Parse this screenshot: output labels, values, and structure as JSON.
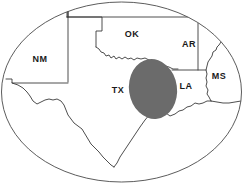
{
  "figure": {
    "type": "region-map",
    "width": 243,
    "height": 185,
    "background_color": "#ffffff",
    "frame": {
      "shape": "ellipse",
      "cx": 121.5,
      "cy": 92,
      "rx": 120,
      "ry": 90,
      "stroke_color": "#4a4a4a",
      "fill": "none"
    },
    "highlight": {
      "shape": "ellipse",
      "label": "shaded-study-area",
      "cx": 153,
      "cy": 89,
      "rx": 24,
      "ry": 30,
      "rotation_deg": -8,
      "fill_color": "#6b6b6b"
    }
  },
  "labels": {
    "new_mexico": "NM",
    "oklahoma": "OK",
    "texas": "TX",
    "arkansas": "AR",
    "louisiana": "LA",
    "mississippi": "MS"
  },
  "label_positions": {
    "new_mexico": {
      "x": 40,
      "y": 60
    },
    "oklahoma": {
      "x": 132,
      "y": 35
    },
    "texas": {
      "x": 118,
      "y": 91
    },
    "arkansas": {
      "x": 189,
      "y": 45
    },
    "louisiana": {
      "x": 186,
      "y": 87
    },
    "mississippi": {
      "x": 219,
      "y": 77
    }
  },
  "colors": {
    "border_stroke": "#3a3a3a",
    "frame_stroke": "#4a4a4a",
    "state_fill": "#ffffff",
    "highlight_fill": "#6b6b6b",
    "label_text": "#1a1a1a",
    "page_background": "#ffffff"
  }
}
